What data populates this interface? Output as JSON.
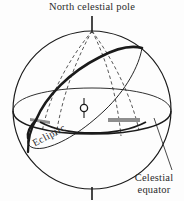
{
  "figure": {
    "kind": "celestial-sphere-diagram",
    "background_color": "#fdfdfd",
    "ink_color": "#1a1a1a",
    "shade_color": "#8e8e8e",
    "labels": {
      "north_celestial_pole": "North celestial pole",
      "celestial_equator_line1": "Celestial",
      "celestial_equator_line2": "equator",
      "ecliptic": "Ecliptic"
    },
    "elements": {
      "sphere_outline": "sphere-outline",
      "celestial_equator_plane": "celestial-equator-ellipse",
      "ecliptic_great_circle": "ecliptic-great-circle",
      "meridian_count": 4,
      "earth_glyph": "earth-symbol",
      "polar_axis_tick_top": "north-pole-axis-tick",
      "polar_axis_tick_bottom": "south-pole-axis-tick",
      "equinox_shading_left": "vernal-equinox-shade",
      "equinox_shading_right": "autumnal-equinox-shade",
      "leader_line_equator": "celestial-equator-leader-line"
    }
  }
}
